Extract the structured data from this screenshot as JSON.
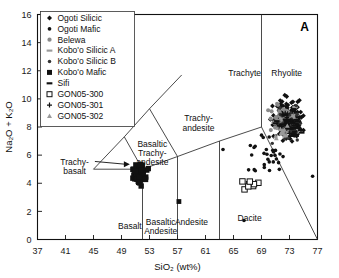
{
  "panel": {
    "label": "A"
  },
  "axes": {
    "xlabel": "SiO₂ (wt%)",
    "ylabel": "Na₂O + K₂O",
    "xlim": [
      37,
      77
    ],
    "ylim": [
      0,
      16
    ],
    "xticks": [
      37,
      41,
      45,
      49,
      53,
      57,
      61,
      65,
      69,
      73,
      77
    ],
    "yticks": [
      0,
      2,
      4,
      6,
      8,
      10,
      12,
      14,
      16
    ],
    "grid": false
  },
  "legend": {
    "position": "top-left",
    "items": [
      {
        "label": "Ogoti Silicic",
        "marker": "diamond-filled",
        "color": "#111111"
      },
      {
        "label": "Ogoti Mafic",
        "marker": "circle-filled",
        "color": "#111111"
      },
      {
        "label": "Belewa",
        "marker": "circle-small-gray",
        "color": "#8a8a8a"
      },
      {
        "label": "Kobo'o Silicic A",
        "marker": "bar-gray",
        "color": "#9a9a9a"
      },
      {
        "label": "Kobo'o Silicic B",
        "marker": "circle-small-filled",
        "color": "#333333"
      },
      {
        "label": "Kobo'o Mafic",
        "marker": "square-filled",
        "color": "#111111"
      },
      {
        "label": "Sifi",
        "marker": "bar-filled",
        "color": "#111111"
      },
      {
        "label": "GON05-300",
        "marker": "square-open",
        "color": "#111111"
      },
      {
        "label": "GON05-301",
        "marker": "plus",
        "color": "#111111"
      },
      {
        "label": "GON05-302",
        "marker": "triangle-gray",
        "color": "#9a9a9a"
      }
    ]
  },
  "chart_data": {
    "type": "scatter",
    "title": "",
    "xlabel": "SiO₂ (wt%)",
    "ylabel": "Na₂O + K₂O",
    "xlim": [
      37,
      77
    ],
    "ylim": [
      0,
      16
    ],
    "classification": "TAS (Total Alkali–Silica)",
    "fields": [
      {
        "name": "Basalt",
        "label_x": 50.2,
        "label_y": 0.75
      },
      {
        "name": "Basaltic\nAndesite",
        "label_x": 54.6,
        "label_y": 1.05
      },
      {
        "name": "Andesite",
        "label_x": 59.0,
        "label_y": 1.05
      },
      {
        "name": "Dacite",
        "label_x": 67.3,
        "label_y": 1.35
      },
      {
        "name": "Rhyolite",
        "label_x": 72.6,
        "label_y": 11.6
      },
      {
        "name": "Trachyte",
        "label_x": 66.6,
        "label_y": 11.6
      },
      {
        "name": "Trachy-\nandesite",
        "label_x": 60.0,
        "label_y": 8.4
      },
      {
        "name": "Basaltic\nTrachy-\nandesite",
        "label_x": 53.4,
        "label_y": 6.6
      },
      {
        "name": "Trachy-\nbasalt",
        "label_x": 42.3,
        "label_y": 5.3,
        "leader": true
      }
    ],
    "boundaries": [
      {
        "name": "basalt-basaltic-andesite",
        "points": [
          [
            52,
            0
          ],
          [
            52,
            5
          ]
        ]
      },
      {
        "name": "basaltic-andesite-andesite",
        "points": [
          [
            57,
            0
          ],
          [
            57,
            5.9
          ]
        ]
      },
      {
        "name": "andesite-dacite",
        "points": [
          [
            63,
            0
          ],
          [
            63,
            7
          ]
        ]
      },
      {
        "name": "dacite-rhyolite",
        "points": [
          [
            69,
            8
          ],
          [
            77,
            0
          ]
        ]
      },
      {
        "name": "trachyte-rhyolite",
        "points": [
          [
            69,
            8
          ],
          [
            69,
            16
          ]
        ]
      },
      {
        "name": "alkaline-lower",
        "points": [
          [
            45,
            5
          ],
          [
            52,
            5
          ]
        ]
      },
      {
        "name": "basaltic-trachy-andesite-trachy-andesite",
        "points": [
          [
            52,
            5
          ],
          [
            57,
            5.9
          ]
        ]
      },
      {
        "name": "trachy-andesite-trachyte",
        "points": [
          [
            57,
            5.9
          ],
          [
            63,
            7
          ]
        ]
      },
      {
        "name": "trachyte-lower",
        "points": [
          [
            63,
            7
          ],
          [
            69,
            8
          ]
        ]
      },
      {
        "name": "trachybasalt-upper",
        "points": [
          [
            45,
            5
          ],
          [
            49.4,
            7.3
          ]
        ]
      },
      {
        "name": "phonotephrite-line",
        "points": [
          [
            49.4,
            7.3
          ],
          [
            53,
            9.3
          ]
        ]
      },
      {
        "name": "tephriphonolite-line",
        "points": [
          [
            53,
            9.3
          ],
          [
            57.6,
            11.7
          ]
        ]
      },
      {
        "name": "basaltic-trachy-andesite-left",
        "points": [
          [
            49.4,
            7.3
          ],
          [
            52,
            5
          ]
        ]
      },
      {
        "name": "trachy-andesite-left",
        "points": [
          [
            53,
            9.3
          ],
          [
            57,
            5.9
          ]
        ]
      }
    ],
    "series": [
      {
        "name": "Ogoti Silicic",
        "marker": "diamond-filled",
        "color": "#111111",
        "description": "Dense cluster in Rhyolite field",
        "x_range": [
          69,
          77
        ],
        "y_range": [
          6,
          11
        ],
        "n_approx": 180
      },
      {
        "name": "Ogoti Mafic",
        "marker": "circle-filled",
        "color": "#111111",
        "description": "Scattered points, Dacite/Rhyolite margin",
        "x_range": [
          64,
          75
        ],
        "y_range": [
          3,
          9
        ],
        "n_approx": 30
      },
      {
        "name": "Belewa",
        "marker": "circle-small-gray",
        "color": "#8a8a8a",
        "description": "Gray cluster overlapping Rhyolite",
        "x_range": [
          69,
          75
        ],
        "y_range": [
          6.5,
          10.5
        ],
        "n_approx": 60
      },
      {
        "name": "Kobo'o Silicic A",
        "marker": "bar-gray",
        "color": "#9a9a9a",
        "description": "Gray bars within dense silicic cluster",
        "x_range": [
          70,
          76
        ],
        "y_range": [
          7,
          10
        ],
        "n_approx": 45
      },
      {
        "name": "Kobo'o Silicic B",
        "marker": "circle-small-filled",
        "color": "#333333",
        "description": "Small dark circles in silicic cluster",
        "x_range": [
          69,
          76
        ],
        "y_range": [
          6,
          10
        ],
        "n_approx": 50
      },
      {
        "name": "Kobo'o Mafic",
        "marker": "square-filled",
        "color": "#111111",
        "description": "Mafic cluster near Basalt / Basaltic Trachy-andesite boundary",
        "x_range": [
          49,
          54
        ],
        "y_range": [
          3.2,
          6.2
        ],
        "n_approx": 45
      },
      {
        "name": "Sifi",
        "marker": "bar-filled",
        "color": "#111111",
        "description": "Dark bars within silicic cluster",
        "x_range": [
          70,
          76
        ],
        "y_range": [
          6.5,
          9.5
        ],
        "n_approx": 40
      },
      {
        "name": "GON05-300",
        "marker": "square-open",
        "color": "#111111",
        "description": "Open squares in Dacite field",
        "x_range": [
          65.5,
          69.5
        ],
        "y_range": [
          3.4,
          4.4
        ],
        "n_approx": 8
      },
      {
        "name": "GON05-301",
        "marker": "plus",
        "color": "#111111",
        "description": "Plus symbols in silicic cluster",
        "x_range": [
          70,
          75
        ],
        "y_range": [
          7,
          9.5
        ],
        "n_approx": 10
      },
      {
        "name": "GON05-302",
        "marker": "triangle-gray",
        "color": "#9a9a9a",
        "description": "Gray triangles in silicic cluster",
        "x_range": [
          69,
          74
        ],
        "y_range": [
          6.5,
          9
        ],
        "n_approx": 12
      }
    ],
    "outliers": [
      {
        "x": 57.2,
        "y": 2.7,
        "marker": "square-filled"
      },
      {
        "x": 66.5,
        "y": 1.35,
        "marker": "circle-filled"
      },
      {
        "x": 76.3,
        "y": 4.5,
        "marker": "circle-filled"
      },
      {
        "x": 63.5,
        "y": 6.4,
        "marker": "circle-filled"
      }
    ]
  }
}
